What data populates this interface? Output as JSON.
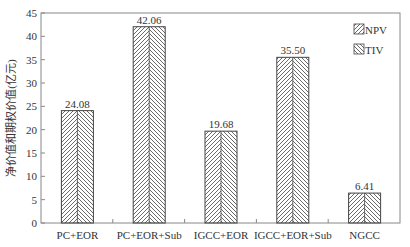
{
  "chart_data": {
    "type": "bar",
    "title": "",
    "xlabel": "",
    "ylabel": "净价值和期权价值(亿元)",
    "ylim": [
      0,
      45
    ],
    "yticks": [
      0,
      5,
      10,
      15,
      20,
      25,
      30,
      35,
      40,
      45
    ],
    "grid": false,
    "legend_position": "upper right",
    "categories": [
      "PC+EOR",
      "PC+EOR+Sub",
      "IGCC+EOR",
      "IGCC+EOR+Sub",
      "NGCC"
    ],
    "values": [
      24.08,
      42.06,
      19.68,
      35.5,
      6.41
    ],
    "value_labels": [
      "24.08",
      "42.06",
      "19.68",
      "35.50",
      "6.41"
    ],
    "series": [
      {
        "name": "NPV",
        "hatch": "/",
        "note": "left half of each bar"
      },
      {
        "name": "TIV",
        "hatch": "\\",
        "note": "right half of each bar"
      }
    ]
  },
  "colors": {
    "axis": "#888888",
    "bar_edge": "#444444",
    "text": "#333333"
  }
}
